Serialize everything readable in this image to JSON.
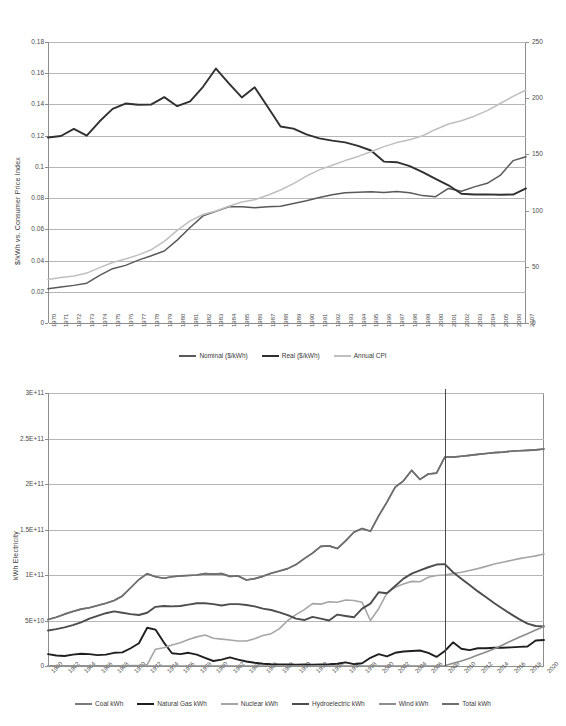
{
  "chart_data": [
    {
      "id": "electricity-price-chart",
      "type": "line",
      "title": "",
      "ylabel": "$/kWh vs. Consumer Price Index",
      "xlabel": "",
      "ylim": [
        0,
        0.18
      ],
      "y2lim": [
        0,
        250
      ],
      "yticks": [
        "0",
        "0.02",
        "0.04",
        "0.06",
        "0.08",
        "0.1",
        "0.12",
        "0.14",
        "0.16",
        "0.18"
      ],
      "y2ticks": [
        "0",
        "50",
        "100",
        "150",
        "200",
        "250"
      ],
      "grid": true,
      "legend_position": "bottom",
      "x": [
        1970,
        1971,
        1972,
        1973,
        1974,
        1975,
        1976,
        1977,
        1978,
        1979,
        1980,
        1981,
        1982,
        1983,
        1984,
        1985,
        1986,
        1987,
        1988,
        1989,
        1990,
        1991,
        1992,
        1993,
        1994,
        1995,
        1996,
        1997,
        1998,
        1999,
        2000,
        2001,
        2002,
        2003,
        2004,
        2005,
        2006,
        2007
      ],
      "xticks": [
        "1970",
        "1971",
        "1972",
        "1973",
        "1974",
        "1975",
        "1976",
        "1977",
        "1978",
        "1979",
        "1980",
        "1981",
        "1982",
        "1983",
        "1984",
        "1985",
        "1986",
        "1987",
        "1988",
        "1989",
        "1990",
        "1991",
        "1992",
        "1993",
        "1994",
        "1995",
        "1996",
        "1997",
        "1998",
        "1999",
        "2000",
        "2001",
        "2002",
        "2003",
        "2004",
        "2005",
        "2006",
        "2007"
      ],
      "series": [
        {
          "name": "Nominal ($/kWh)",
          "color": "#595959",
          "axis": "left",
          "values": [
            0.022,
            0.0231,
            0.0241,
            0.0255,
            0.0305,
            0.0348,
            0.0369,
            0.0403,
            0.0431,
            0.0461,
            0.0531,
            0.0612,
            0.0686,
            0.0715,
            0.0745,
            0.0744,
            0.0738,
            0.0745,
            0.0748,
            0.0765,
            0.0783,
            0.0804,
            0.0821,
            0.0835,
            0.0838,
            0.084,
            0.0836,
            0.0843,
            0.0835,
            0.0816,
            0.0809,
            0.0862,
            0.0844,
            0.0872,
            0.0895,
            0.0945,
            0.104,
            0.1065
          ]
        },
        {
          "name": "Real ($/kWh)",
          "color": "#303030",
          "axis": "left",
          "values": [
            0.1188,
            0.1198,
            0.1243,
            0.12,
            0.1292,
            0.1372,
            0.1406,
            0.1398,
            0.14,
            0.1447,
            0.1389,
            0.142,
            0.1513,
            0.163,
            0.1535,
            0.1445,
            0.151,
            0.1385,
            0.1259,
            0.1245,
            0.1208,
            0.1183,
            0.1168,
            0.1157,
            0.1135,
            0.1105,
            0.1034,
            0.103,
            0.1005,
            0.0967,
            0.0923,
            0.0882,
            0.0828,
            0.0823,
            0.0824,
            0.0822,
            0.0823,
            0.0862
          ]
        },
        {
          "name": "Annual CPI",
          "color": "#bfbfbf",
          "axis": "right",
          "values": [
            38.8,
            40.5,
            41.8,
            44.4,
            49.3,
            53.8,
            56.9,
            60.6,
            65.2,
            72.6,
            82.4,
            90.9,
            96.5,
            99.6,
            103.9,
            107.6,
            109.6,
            113.6,
            118.3,
            124.0,
            130.7,
            136.2,
            140.3,
            144.5,
            148.2,
            152.4,
            156.9,
            160.5,
            163.0,
            166.6,
            172.2,
            177.1,
            179.9,
            184.0,
            188.9,
            195.3,
            201.6,
            207.3
          ]
        }
      ]
    },
    {
      "id": "electricity-generation-chart",
      "type": "line",
      "title": "",
      "ylabel": "kWh Electricity",
      "xlabel": "",
      "ylim": [
        0,
        300000000000
      ],
      "yticks": [
        "0",
        "5E+10",
        "1E+11",
        "1.5E+11",
        "2E+11",
        "2.5E+11",
        "3E+11"
      ],
      "grid": true,
      "legend_position": "bottom",
      "forecast_divider_year": 2008,
      "xticks": [
        "1960",
        "1962",
        "1964",
        "1966",
        "1968",
        "1970",
        "1972",
        "1974",
        "1976",
        "1978",
        "1980",
        "1982",
        "1984",
        "1986",
        "1988",
        "1990",
        "1992",
        "1994",
        "1996",
        "1998",
        "2000",
        "2002",
        "2004",
        "2006",
        "2008",
        "2010",
        "2012",
        "2014",
        "2016",
        "2018",
        "2020"
      ],
      "x": [
        1960,
        1961,
        1962,
        1963,
        1964,
        1965,
        1966,
        1967,
        1968,
        1969,
        1970,
        1971,
        1972,
        1973,
        1974,
        1975,
        1976,
        1977,
        1978,
        1979,
        1980,
        1981,
        1982,
        1983,
        1984,
        1985,
        1986,
        1987,
        1988,
        1989,
        1990,
        1991,
        1992,
        1993,
        1994,
        1995,
        1996,
        1997,
        1998,
        1999,
        2000,
        2001,
        2002,
        2003,
        2004,
        2005,
        2006,
        2007,
        2008,
        2009,
        2010,
        2011,
        2012,
        2013,
        2014,
        2015,
        2016,
        2017,
        2018,
        2019,
        2020
      ],
      "series": [
        {
          "name": "Coal kWh",
          "color": "#7a7a7a",
          "values": [
            51.0,
            53.5,
            57.0,
            60.0,
            62.5,
            64.0,
            66.5,
            69.0,
            72.0,
            77.0,
            86.0,
            95.0,
            101.5,
            98.0,
            96.5,
            98.0,
            99.0,
            99.5,
            100.0,
            101.5,
            101.0,
            101.5,
            98.5,
            99.0,
            94.5,
            96.0,
            98.5,
            102.0,
            104.5,
            107.0,
            111.5,
            118.0,
            124.0,
            131.5,
            132.0,
            129.0,
            137.5,
            147.0,
            151.0,
            148.0,
            165.0,
            180.0,
            196.5,
            203.5,
            215.0,
            205.0,
            211.0,
            212.0,
            229.5,
            229.5,
            230.5,
            231.5,
            232.5,
            233.5,
            234.5,
            235.0,
            236.0,
            236.5,
            237.0,
            237.5,
            238.5
          ]
        },
        {
          "name": "Natural Gas kWh",
          "color": "#1f1f1f",
          "values": [
            13.0,
            11.5,
            11.0,
            12.5,
            13.5,
            13.0,
            12.0,
            12.5,
            14.5,
            15.0,
            19.5,
            25.0,
            42.0,
            40.0,
            26.0,
            14.0,
            13.0,
            14.5,
            12.5,
            9.0,
            5.5,
            7.0,
            9.5,
            7.0,
            5.0,
            3.5,
            2.5,
            2.0,
            1.8,
            1.6,
            1.5,
            1.6,
            1.5,
            1.8,
            2.0,
            2.5,
            4.0,
            2.0,
            3.0,
            9.0,
            13.0,
            10.5,
            14.5,
            16.0,
            16.5,
            17.0,
            14.5,
            10.0,
            16.5,
            26.0,
            19.0,
            17.5,
            19.5,
            19.5,
            20.0,
            20.0,
            20.5,
            21.0,
            21.5,
            28.0,
            28.5
          ]
        },
        {
          "name": "Nuclear kWh",
          "color": "#a6a6a6",
          "values": [
            0.3,
            0.3,
            0.3,
            0.3,
            0.3,
            0.3,
            0.3,
            0.3,
            0.3,
            0.3,
            0.4,
            0.5,
            1.5,
            18.5,
            20.0,
            23.0,
            25.5,
            29.0,
            32.0,
            34.0,
            30.5,
            29.5,
            28.5,
            27.5,
            27.5,
            30.0,
            33.5,
            35.5,
            41.0,
            50.0,
            56.5,
            62.0,
            68.5,
            68.0,
            70.5,
            70.0,
            72.5,
            72.0,
            70.0,
            50.0,
            63.0,
            80.0,
            86.5,
            90.0,
            93.0,
            92.5,
            97.5,
            99.5,
            100.0,
            101.5,
            103.0,
            105.0,
            107.0,
            109.5,
            112.0,
            114.0,
            116.0,
            118.0,
            119.5,
            121.0,
            123.0
          ]
        },
        {
          "name": "Hydroelectric kWh",
          "color": "#4d4d4d",
          "values": [
            39.0,
            40.5,
            42.5,
            45.0,
            48.0,
            52.0,
            55.0,
            58.0,
            60.0,
            58.5,
            57.0,
            56.0,
            58.5,
            65.0,
            66.0,
            65.5,
            66.0,
            67.5,
            69.0,
            69.0,
            68.0,
            66.5,
            68.0,
            68.0,
            67.0,
            65.5,
            63.0,
            61.5,
            59.0,
            56.0,
            52.0,
            50.5,
            54.0,
            52.0,
            50.0,
            56.5,
            55.0,
            53.5,
            63.0,
            68.5,
            81.0,
            80.0,
            88.0,
            96.0,
            101.5,
            105.0,
            108.5,
            111.5,
            112.0,
            103.0,
            96.0,
            89.0,
            82.0,
            75.5,
            69.0,
            63.0,
            57.0,
            51.5,
            46.5,
            44.0,
            43.5
          ]
        },
        {
          "name": "Wind kWh",
          "color": "#8c8c8c",
          "values": [
            0,
            0,
            0,
            0,
            0,
            0,
            0,
            0,
            0,
            0,
            0,
            0,
            0,
            0,
            0,
            0,
            0,
            0,
            0,
            0,
            0,
            0,
            0,
            0,
            0,
            0,
            0,
            0,
            0,
            0,
            0,
            0,
            0,
            0,
            0,
            0,
            0,
            0,
            0,
            0,
            0,
            0,
            0,
            0,
            0,
            0,
            0,
            0,
            0.2,
            3.0,
            5.5,
            8.5,
            12.0,
            15.5,
            19.0,
            23.0,
            27.5,
            31.5,
            35.5,
            39.5,
            43.5
          ]
        },
        {
          "name": "Total kWh",
          "color": "#6e6e6e",
          "values": [
            51.0,
            53.5,
            57.0,
            60.0,
            62.5,
            64.0,
            66.5,
            69.0,
            72.0,
            77.0,
            86.0,
            95.0,
            101.5,
            98.0,
            96.5,
            98.0,
            99.0,
            99.5,
            100.0,
            101.5,
            101.0,
            101.5,
            98.5,
            99.0,
            94.5,
            96.0,
            98.5,
            102.0,
            104.5,
            107.0,
            111.5,
            118.0,
            124.0,
            131.5,
            132.0,
            129.0,
            137.5,
            147.0,
            151.0,
            148.0,
            165.0,
            180.0,
            196.5,
            203.5,
            215.0,
            205.0,
            211.0,
            212.0,
            229.5,
            229.5,
            230.5,
            231.5,
            232.5,
            233.5,
            234.5,
            235.0,
            236.0,
            236.5,
            237.0,
            237.5,
            238.5
          ]
        }
      ]
    }
  ],
  "panels": {
    "top": {
      "ylabel": "$/kWh vs. Consumer Price Index",
      "legend": [
        {
          "label": "Nominal ($/kWh)",
          "color": "#595959"
        },
        {
          "label": "Real ($/kWh)",
          "color": "#303030"
        },
        {
          "label": "Annual CPI",
          "color": "#bfbfbf"
        }
      ]
    },
    "bottom": {
      "ylabel": "kWh Electricity",
      "legend": [
        {
          "label": "Coal kWh",
          "color": "#7a7a7a"
        },
        {
          "label": "Natural Gas kWh",
          "color": "#1f1f1f"
        },
        {
          "label": "Nuclear kWh",
          "color": "#a6a6a6"
        },
        {
          "label": "Hydroelectric kWh",
          "color": "#4d4d4d"
        },
        {
          "label": "Wind kWh",
          "color": "#8c8c8c"
        },
        {
          "label": "Total kWh",
          "color": "#6e6e6e"
        }
      ]
    }
  }
}
